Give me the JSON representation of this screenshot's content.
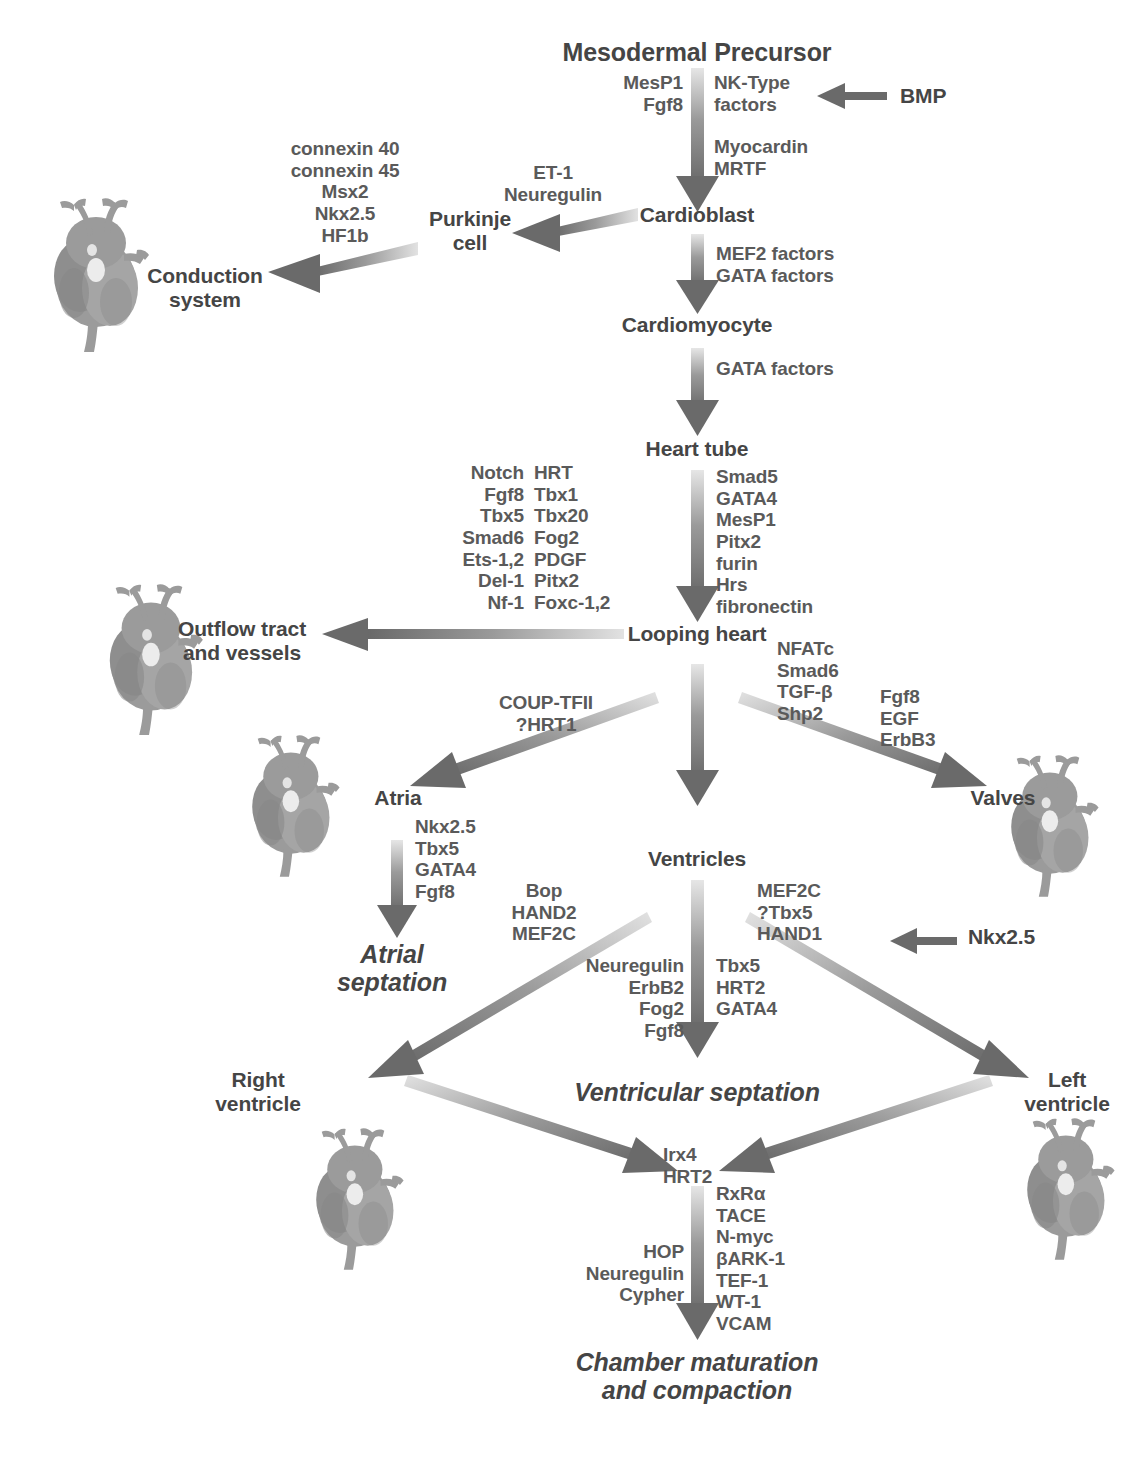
{
  "diagram": {
    "colors": {
      "text": "#4a4a4a",
      "factor_text": "#5a5a5a",
      "arrow_dark": "#6f6f6f",
      "arrow_light": "#d8d8d8",
      "heart_fill": "#9a9a9a",
      "background": "#ffffff"
    }
  },
  "nodes": {
    "mesodermal_precursor": "Mesodermal Precursor",
    "cardioblast": "Cardioblast",
    "cardiomyocyte": "Cardiomyocyte",
    "heart_tube": "Heart tube",
    "looping_heart": "Looping heart",
    "ventricles": "Ventricles",
    "atria": "Atria",
    "valves": "Valves",
    "outflow_tract": "Outflow tract\nand vessels",
    "conduction_system": "Conduction\nsystem",
    "purkinje_cell": "Purkinje\ncell",
    "atrial_septation": "Atrial\nseptation",
    "ventricular_septation": "Ventricular septation",
    "right_ventricle": "Right\nventricle",
    "left_ventricle": "Left\nventricle",
    "chamber_maturation": "Chamber maturation\nand compaction"
  },
  "inputs": {
    "bmp": "BMP",
    "nkx25_to_hand1": "Nkx2.5"
  },
  "factor_groups": {
    "precursor_left": [
      "MesP1",
      "Fgf8"
    ],
    "precursor_right_top": [
      "NK-Type",
      "factors"
    ],
    "precursor_right_bottom": [
      "Myocardin",
      "MRTF"
    ],
    "cardioblast_to_cardiomyocyte": [
      "MEF2 factors",
      "GATA factors"
    ],
    "cardiomyocyte_to_heart_tube": [
      "GATA factors"
    ],
    "heart_tube_to_looping": [
      "Smad5",
      "GATA4",
      "MesP1",
      "Pitx2",
      "furin",
      "Hrs",
      "fibronectin"
    ],
    "conduction": [
      "connexin 40",
      "connexin 45",
      "Msx2",
      "Nkx2.5",
      "HF1b"
    ],
    "purkinje": [
      "ET-1",
      "Neuregulin"
    ],
    "outflow_col1": [
      "Notch",
      "Fgf8",
      "Tbx5",
      "Smad6",
      "Ets-1,2",
      "Del-1",
      "Nf-1"
    ],
    "outflow_col2": [
      "HRT",
      "Tbx1",
      "Tbx20",
      "Fog2",
      "PDGF",
      "Pitx2",
      "Foxc-1,2"
    ],
    "atria_branch": [
      "COUP-TFII",
      "?HRT1"
    ],
    "valves_col1": [
      "NFATc",
      "Smad6",
      "TGF-β",
      "Shp2"
    ],
    "valves_col2": [
      "Fgf8",
      "EGF",
      "ErbB3"
    ],
    "atrial_septation": [
      "Nkx2.5",
      "Tbx5",
      "GATA4",
      "Fgf8"
    ],
    "right_ventricle_branch": [
      "Bop",
      "HAND2",
      "MEF2C"
    ],
    "left_ventricle_branch": [
      "MEF2C",
      "?Tbx5",
      "HAND1"
    ],
    "vent_septation_left": [
      "Neuregulin",
      "ErbB2",
      "Fog2",
      "Fgf8"
    ],
    "vent_septation_right": [
      "Tbx5",
      "HRT2",
      "GATA4"
    ],
    "convergence": [
      "Irx4",
      "HRT2"
    ],
    "maturation_left": [
      "HOP",
      "Neuregulin",
      "Cypher"
    ],
    "maturation_right": [
      "RxRα",
      "TACE",
      "N-myc",
      "βARK-1",
      "TEF-1",
      "WT-1",
      "VCAM"
    ]
  },
  "heart_images": [
    {
      "name": "heart-conduction-system",
      "label": "conduction system heart"
    },
    {
      "name": "heart-outflow-tract",
      "label": "outflow tract heart"
    },
    {
      "name": "heart-atria",
      "label": "atria heart"
    },
    {
      "name": "heart-valves",
      "label": "valves heart"
    },
    {
      "name": "heart-right-ventricle",
      "label": "right ventricle heart"
    },
    {
      "name": "heart-left-ventricle",
      "label": "left ventricle heart"
    }
  ]
}
